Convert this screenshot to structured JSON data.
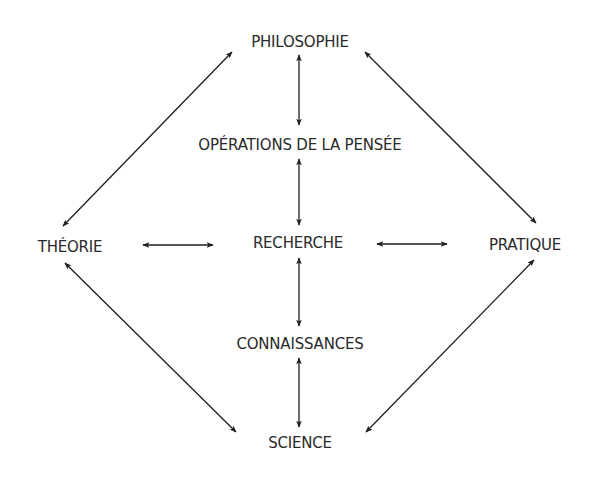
{
  "diagram": {
    "type": "concept-map",
    "ink_color": "#1e1e1e",
    "text_color": "#2a2a2a",
    "nodes": {
      "philosophie": {
        "label": "PHILOSOPHIE",
        "x": 300,
        "y": 42
      },
      "operations": {
        "label": "OPÉRATIONS DE LA PENSÉE",
        "x": 300,
        "y": 145
      },
      "theorie": {
        "label": "THÉORIE",
        "x": 70,
        "y": 247
      },
      "recherche": {
        "label": "RECHERCHE",
        "x": 298,
        "y": 243
      },
      "pratique": {
        "label": "PRATIQUE",
        "x": 525,
        "y": 245
      },
      "connaissances": {
        "label": "CONNAISSANCES",
        "x": 300,
        "y": 344
      },
      "science": {
        "label": "SCIENCE",
        "x": 300,
        "y": 443
      }
    },
    "edges": [
      {
        "from": "philosophie",
        "to": "operations",
        "bidirectional": true
      },
      {
        "from": "operations",
        "to": "recherche",
        "bidirectional": true
      },
      {
        "from": "recherche",
        "to": "connaissances",
        "bidirectional": true
      },
      {
        "from": "connaissances",
        "to": "science",
        "bidirectional": true
      },
      {
        "from": "theorie",
        "to": "recherche",
        "bidirectional": true
      },
      {
        "from": "recherche",
        "to": "pratique",
        "bidirectional": true
      },
      {
        "from": "philosophie",
        "to": "theorie",
        "bidirectional": true
      },
      {
        "from": "philosophie",
        "to": "pratique",
        "bidirectional": true
      },
      {
        "from": "theorie",
        "to": "science",
        "bidirectional": true
      },
      {
        "from": "pratique",
        "to": "science",
        "bidirectional": true
      }
    ]
  }
}
